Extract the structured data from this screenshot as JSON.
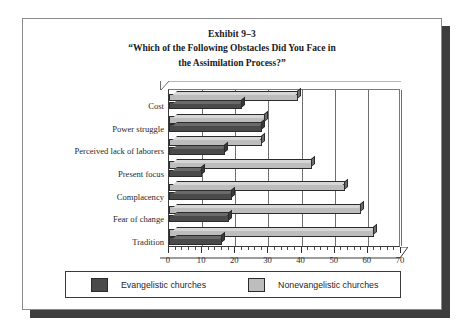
{
  "exhibit": {
    "number_label": "Exhibit 9–3",
    "question_line1": "“Which of the Following Obstacles Did You Face in",
    "question_line2": "the Assimilation Process?”"
  },
  "legend": {
    "series1_label": "Evangelistic churches",
    "series2_label": "Nonevangelistic churches",
    "series1_color": "#4a4a4a",
    "series2_color": "#bdbdbd"
  },
  "chart_data": {
    "type": "bar",
    "orientation": "horizontal",
    "xlabel": "",
    "ylabel": "",
    "xlim": [
      0,
      70
    ],
    "xticks": [
      0,
      10,
      20,
      30,
      40,
      50,
      60,
      70
    ],
    "xtick_labels": [
      "0",
      "10",
      "20",
      "30",
      "40",
      "50",
      "60",
      "70"
    ],
    "minor_tick_step": 2,
    "grid": "vertical",
    "legend_position": "bottom",
    "categories": [
      "Cost",
      "Power struggle",
      "Perceived lack of laborers",
      "Present focus",
      "Complacency",
      "Fear of change",
      "Tradition"
    ],
    "series": [
      {
        "name": "Evangelistic churches",
        "color": "#4a4a4a",
        "values": [
          22,
          28,
          17,
          10,
          19,
          18,
          16
        ]
      },
      {
        "name": "Nonevangelistic churches",
        "color": "#bdbdbd",
        "values": [
          39,
          29,
          28,
          43,
          53,
          58,
          62
        ]
      }
    ]
  }
}
